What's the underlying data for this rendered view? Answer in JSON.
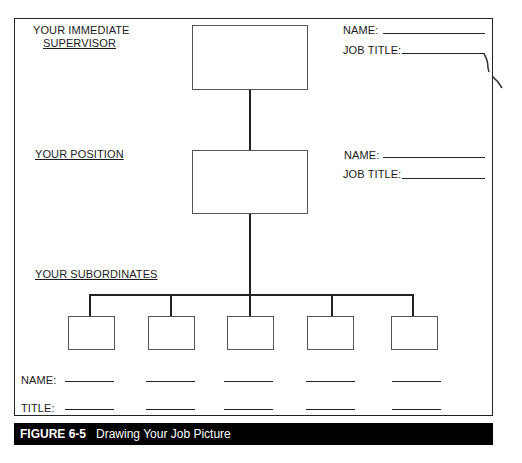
{
  "supervisor": {
    "section_label_line1": "YOUR IMMEDIATE",
    "section_label_line2": "SUPERVISOR",
    "name_label": "NAME:",
    "job_title_label": "JOB TITLE:"
  },
  "position": {
    "section_label": "YOUR POSITION",
    "name_label": "NAME:",
    "job_title_label": "JOB TITLE:"
  },
  "subordinates": {
    "section_label": "YOUR SUBORDINATES",
    "count": 5,
    "name_label": "NAME:",
    "title_label": "TITLE:"
  },
  "caption": {
    "figure_number": "FIGURE 6-5",
    "title": "Drawing Your Job Picture"
  },
  "colors": {
    "line": "#222222",
    "box_border": "#555555",
    "caption_bg": "#000000",
    "caption_text": "#ffffff"
  }
}
